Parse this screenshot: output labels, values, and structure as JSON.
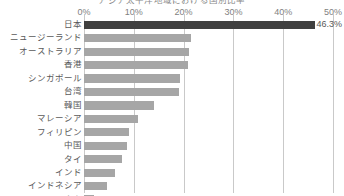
{
  "chart_data": {
    "type": "bar",
    "orientation": "horizontal",
    "title": "アジア太平洋地域における国別比率",
    "xlabel": "",
    "ylabel": "",
    "xlim": [
      0,
      50
    ],
    "xticks": [
      "0%",
      "10%",
      "20%",
      "30%",
      "40%",
      "50%"
    ],
    "xtick_values": [
      0,
      10,
      20,
      30,
      40,
      50
    ],
    "grid": true,
    "legend": false,
    "categories": [
      "日本",
      "ニュージーランド",
      "オーストラリア",
      "香港",
      "シンガポール",
      "台湾",
      "韓国",
      "マレーシア",
      "フィリピン",
      "中国",
      "タイ",
      "インド",
      "インドネシア",
      "ベトナム"
    ],
    "values": [
      46.3,
      21.5,
      21.0,
      20.8,
      19.2,
      19.0,
      14.0,
      10.8,
      9.0,
      8.6,
      7.6,
      6.2,
      4.6,
      2.0
    ],
    "data_labels": [
      "46.3%",
      "",
      "",
      "",
      "",
      "",
      "",
      "",
      "",
      "",
      "",
      "",
      "",
      "2.0%"
    ],
    "bar_colors": [
      "#404040",
      "#a6a6a6",
      "#a6a6a6",
      "#a6a6a6",
      "#a6a6a6",
      "#a6a6a6",
      "#a6a6a6",
      "#a6a6a6",
      "#a6a6a6",
      "#a6a6a6",
      "#a6a6a6",
      "#a6a6a6",
      "#a6a6a6",
      "#a6a6a6"
    ],
    "highlight_color": "#404040",
    "series_color": "#a6a6a6",
    "gridline_color": "#c9c9c9",
    "text_color": "#595959"
  }
}
